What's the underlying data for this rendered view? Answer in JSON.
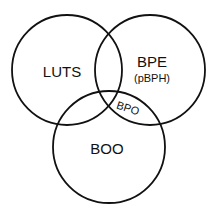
{
  "diagram": {
    "type": "venn",
    "stroke_color": "#111111",
    "background": "#ffffff",
    "sets": [
      {
        "id": "luts",
        "label": "LUTS",
        "cx": 67,
        "cy": 70,
        "r": 55
      },
      {
        "id": "bpe",
        "label": "BPE",
        "sublabel": "(pBPH)",
        "cx": 150,
        "cy": 70,
        "r": 55
      },
      {
        "id": "boo",
        "label": "BOO",
        "cx": 109,
        "cy": 147,
        "r": 56
      }
    ],
    "intersections": [
      {
        "sets": [
          "bpe",
          "boo"
        ],
        "label": "BPO",
        "rotation_deg": 18
      }
    ]
  }
}
